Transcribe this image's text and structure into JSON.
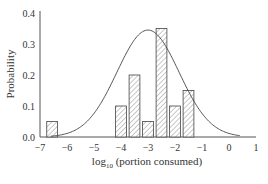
{
  "chart_data": {
    "type": "bar",
    "title": "",
    "xlabel": "log10 (portion consumed)",
    "xlabel_main": "log",
    "xlabel_sub": "10",
    "xlabel_rest": " (portion consumed)",
    "ylabel": "Probability",
    "xlim": [
      -7,
      1
    ],
    "ylim": [
      0.0,
      0.4
    ],
    "xticks": [
      "−7",
      "−6",
      "−5",
      "−4",
      "−3",
      "−2",
      "−1",
      "0",
      "1"
    ],
    "xtick_values": [
      -7,
      -6,
      -5,
      -4,
      -3,
      -2,
      -1,
      0,
      1
    ],
    "yticks": [
      "0.0",
      "0.1",
      "0.2",
      "0.3",
      "0.4"
    ],
    "ytick_values": [
      0.0,
      0.1,
      0.2,
      0.3,
      0.4
    ],
    "grid": false,
    "legend": null,
    "bars": [
      {
        "x_start": -6.75,
        "x_end": -6.35,
        "value": 0.05
      },
      {
        "x_start": -4.2,
        "x_end": -3.8,
        "value": 0.1
      },
      {
        "x_start": -3.7,
        "x_end": -3.3,
        "value": 0.2
      },
      {
        "x_start": -3.2,
        "x_end": -2.8,
        "value": 0.05
      },
      {
        "x_start": -2.7,
        "x_end": -2.3,
        "value": 0.35
      },
      {
        "x_start": -2.2,
        "x_end": -1.8,
        "value": 0.1
      },
      {
        "x_start": -1.7,
        "x_end": -1.3,
        "value": 0.15
      }
    ],
    "series": [
      {
        "name": "histogram",
        "type": "bar",
        "style": "hatched",
        "x": [
          -6.55,
          -4.0,
          -3.5,
          -3.0,
          -2.5,
          -2.0,
          -1.5
        ],
        "values": [
          0.05,
          0.1,
          0.2,
          0.05,
          0.35,
          0.1,
          0.15
        ]
      },
      {
        "name": "fitted normal curve",
        "type": "line",
        "mean": -3.0,
        "sd": 1.15,
        "peak": 0.345
      }
    ]
  }
}
